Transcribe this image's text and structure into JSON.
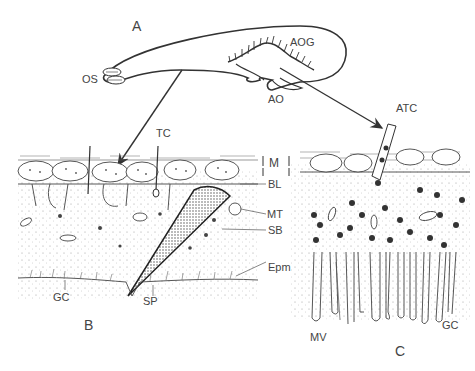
{
  "figure": {
    "panels": [
      {
        "id": "A",
        "label": "A",
        "description": "Whole organ outline"
      },
      {
        "id": "B",
        "label": "B",
        "description": "Section of epithelium with spine"
      },
      {
        "id": "C",
        "label": "C",
        "description": "Section of accessory organ epithelium"
      }
    ],
    "labels": {
      "panel_a": "A",
      "panel_b": "B",
      "panel_c": "C",
      "os": "OS",
      "aog": "AOG",
      "ao": "AO",
      "atc": "ATC",
      "tc": "TC",
      "m": "M",
      "bl": "BL",
      "mt": "MT",
      "sb": "SB",
      "epm": "Epm",
      "gc_b": "GC",
      "sp": "SP",
      "mv": "MV",
      "gc_c": "GC"
    },
    "colors": {
      "ink": "#333333",
      "stipple": "#9a9a9a",
      "granule": "#3a3a3a",
      "background": "#ffffff"
    }
  }
}
